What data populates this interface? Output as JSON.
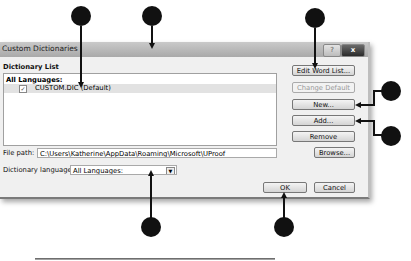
{
  "dialog": {
    "title": "Custom Dictionaries",
    "help_glyph": "?",
    "close_glyph": "x",
    "dictionary_list_label": "Dictionary List",
    "group_header": "All Languages:",
    "items": [
      {
        "checked": true,
        "check_glyph": "✓",
        "label": "CUSTOM.DIC (Default)"
      }
    ],
    "buttons": {
      "edit_word_list": "Edit Word List...",
      "change_default": "Change Default",
      "new": "New...",
      "add": "Add...",
      "remove": "Remove",
      "browse": "Browse...",
      "ok": "OK",
      "cancel": "Cancel"
    },
    "file_path_label": "File path:",
    "file_path_value": "C:\\Users\\Katherine\\AppData\\Roaming\\Microsoft\\UProof",
    "dictionary_language_label": "Dictionary language:",
    "dictionary_language_value": "All Languages:",
    "dropdown_glyph": "▼"
  },
  "callouts": [
    "",
    "",
    "",
    "",
    "",
    "",
    ""
  ]
}
